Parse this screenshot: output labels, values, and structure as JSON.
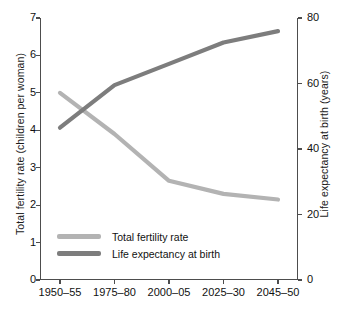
{
  "chart_data": {
    "type": "line",
    "title": "",
    "xlabel": "",
    "categories": [
      "1950–55",
      "1975–80",
      "2000–05",
      "2025–30",
      "2045–50"
    ],
    "grid": false,
    "legend_position": "inside-lower-left",
    "axes": {
      "left": {
        "label": "Total fertility rate (children per woman)",
        "ticks": [
          "0",
          "1",
          "2",
          "3",
          "4",
          "5",
          "6",
          "7"
        ],
        "tick_values": [
          0,
          1,
          2,
          3,
          4,
          5,
          6,
          7
        ],
        "ylim": [
          0,
          7
        ]
      },
      "right": {
        "label": "Life expectancy at birth (years)",
        "ticks": [
          "0",
          "20",
          "40",
          "60",
          "80"
        ],
        "tick_values": [
          0,
          20,
          40,
          60,
          80
        ],
        "ylim": [
          0,
          80
        ]
      }
    },
    "series": [
      {
        "name": "Total fertility rate",
        "axis": "left",
        "color": "#b3b3b3",
        "values": [
          5.0,
          3.9,
          2.65,
          2.3,
          2.15
        ]
      },
      {
        "name": "Life expectancy at birth",
        "axis": "right",
        "color": "#7d7d7d",
        "values": [
          46.5,
          59.5,
          66.0,
          72.5,
          76.0
        ]
      }
    ],
    "legend": [
      {
        "label": "Total fertility rate",
        "color": "#b3b3b3"
      },
      {
        "label": "Life expectancy at birth",
        "color": "#7d7d7d"
      }
    ]
  }
}
